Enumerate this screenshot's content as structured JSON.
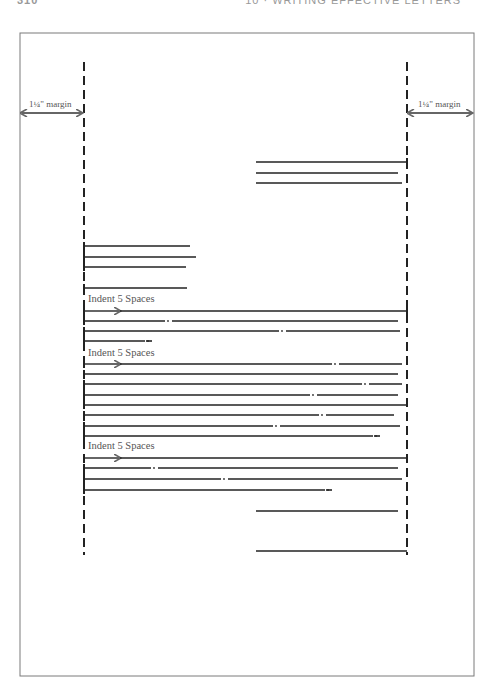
{
  "header": {
    "page_number": "310",
    "chapter_title": "10 · WRITING EFFECTIVE LETTERS"
  },
  "diagram": {
    "left_margin_label": "1¼\" margin",
    "right_margin_label": "1¼\" margin",
    "indent_label": "Indent 5 Spaces",
    "paragraph_count": 3,
    "colors": {
      "frame": "#7a7a7a",
      "lines": "#222222",
      "arrows": "#666666"
    }
  }
}
